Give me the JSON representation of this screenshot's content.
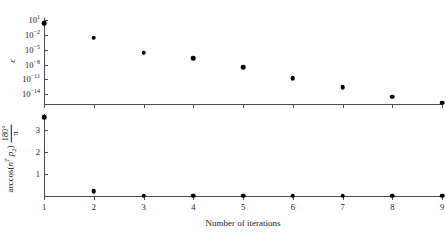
{
  "chart_data": [
    {
      "type": "scatter",
      "panel": "top",
      "title": "",
      "xlabel": "Number of iterations",
      "ylabel": "ε",
      "yscale": "log",
      "x": [
        1,
        2,
        3,
        4,
        5,
        6,
        7,
        8,
        9
      ],
      "values": [
        3.0,
        0.003,
        3e-06,
        2e-07,
        3e-09,
        2e-11,
        3e-13,
        3e-15,
        2e-16
      ],
      "xticklabels": [
        "1",
        "2",
        "3",
        "4",
        "5",
        "6",
        "7",
        "8",
        "9"
      ],
      "yticklabels": [
        "10^1",
        "10^-2",
        "10^-5",
        "10^-8",
        "10^-11",
        "10^-14"
      ],
      "ytick_exponents": [
        1,
        -2,
        -5,
        -8,
        -11,
        -14
      ],
      "ytick_mantissa": "10",
      "ylim": [
        1e-16,
        31.6
      ],
      "xlim": [
        1,
        9
      ],
      "grid": false,
      "legend": false,
      "marker": "filled-circle",
      "marker_color": "#000000"
    },
    {
      "type": "scatter",
      "panel": "bottom",
      "title": "",
      "xlabel": "Number of iterations",
      "ylabel": "arccos (n^T p_2) 180°/π",
      "ylabel_parts": {
        "function": "arccos",
        "argument_open": "(",
        "vector_n": "n",
        "transpose": "T",
        "vector_p": "p",
        "p_index": "2",
        "argument_close": ")",
        "fraction_numerator": "180°",
        "fraction_denominator": "π"
      },
      "yscale": "linear",
      "x": [
        1,
        2,
        3,
        4,
        5,
        6,
        7,
        8,
        9
      ],
      "values": [
        3.55,
        0.22,
        0.02,
        0.015,
        0.012,
        0.012,
        0.012,
        0.012,
        0.012
      ],
      "xticklabels": [
        "1",
        "2",
        "3",
        "4",
        "5",
        "6",
        "7",
        "8",
        "9"
      ],
      "yticklabels": [
        "1",
        "2",
        "3"
      ],
      "ytickvalues": [
        1,
        2,
        3
      ],
      "ylim": [
        0,
        3.7
      ],
      "xlim": [
        1,
        9
      ],
      "grid": false,
      "legend": false,
      "marker": "filled-circle",
      "marker_color": "#000000"
    }
  ],
  "axes": {
    "shared_xlabel": "Number of iterations",
    "axis_color": "#4a4a4a"
  }
}
